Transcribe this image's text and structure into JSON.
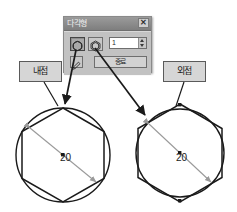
{
  "dialog": {
    "title": "다각형",
    "close_label": "✕",
    "close_icon": "close-icon",
    "option_inscribed": {
      "icon": "polygon-inscribed-in-circle-icon",
      "selected": true
    },
    "option_circumscribed": {
      "icon": "circle-inscribed-in-polygon-icon",
      "selected": false
    },
    "spinner": {
      "value": "1",
      "placeholder": "1"
    },
    "small_button": {
      "icon": "pencil-icon"
    },
    "primary_button": {
      "label": "종료"
    }
  },
  "callouts": {
    "inscribed": "내접",
    "circumscribed": "외접"
  },
  "diagrams": {
    "left": {
      "name": "inscribed-polygon-diagram",
      "dimension": "20",
      "polygon_sides": 6,
      "center_marker": true
    },
    "right": {
      "name": "circumscribed-polygon-diagram",
      "dimension": "20",
      "polygon_sides": 6,
      "center_marker": true
    }
  },
  "colors": {
    "outline": "#1a1a1a",
    "dimension_line": "#9a9a9a",
    "dialog_face": "#c2c2c2",
    "titlebar": "#8f8f8f",
    "callout_face": "#d6d6d6",
    "arrow": "#1a1a1a"
  }
}
